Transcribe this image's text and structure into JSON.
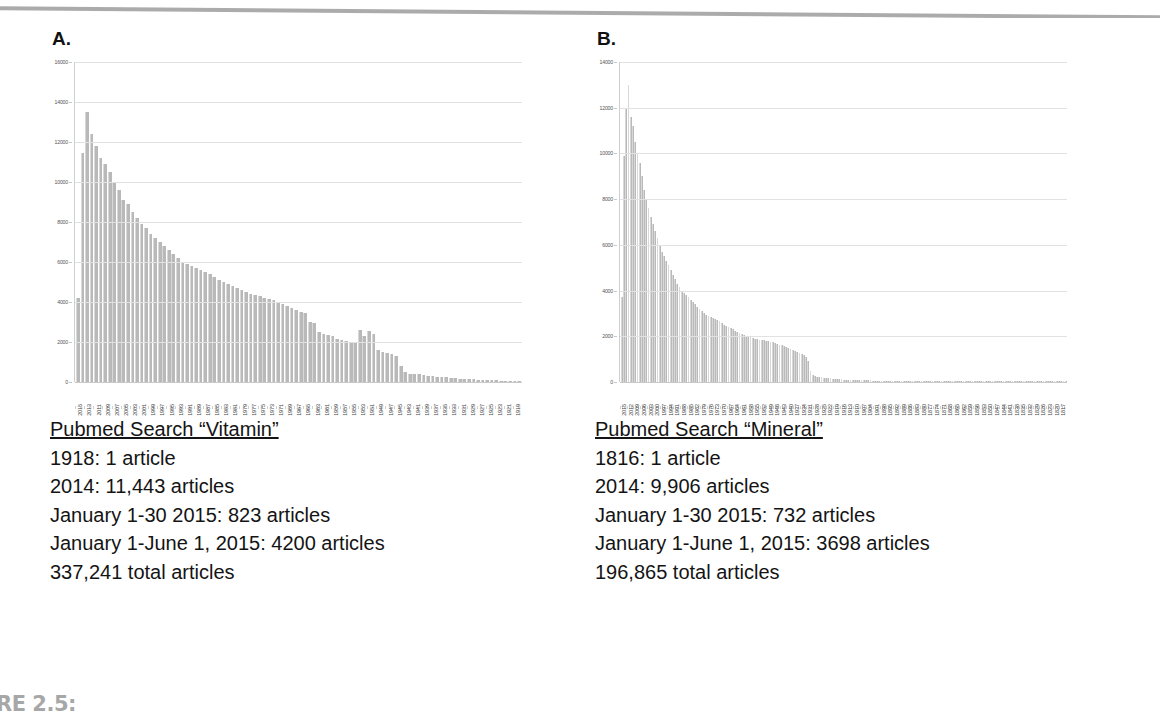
{
  "figure_label": "RE 2.5:",
  "panels": [
    {
      "letter": "A.",
      "caption": {
        "title": "Pubmed Search “Vitamin”",
        "lines": [
          "1918: 1 article",
          "2014: 11,443 articles",
          "January 1-30 2015: 823 articles",
          "January 1-June 1, 2015: 4200 articles",
          "337,241 total articles"
        ]
      }
    },
    {
      "letter": "B.",
      "caption": {
        "title": "Pubmed Search “Mineral”",
        "lines": [
          "1816: 1 article",
          "2014: 9,906 articles",
          "January 1-30 2015: 732 articles",
          "January 1-June 1, 2015: 3698 articles",
          "196,865 total articles"
        ]
      }
    }
  ],
  "chart_data": [
    {
      "type": "bar",
      "title": "Pubmed Search “Vitamin”",
      "xlabel": "",
      "ylabel": "",
      "ylim": [
        0,
        16000
      ],
      "yticks": [
        0,
        2000,
        4000,
        6000,
        8000,
        10000,
        12000,
        14000,
        16000
      ],
      "grid": true,
      "legend": "none",
      "label_step": 2,
      "categories": [
        2015,
        2014,
        2013,
        2012,
        2011,
        2010,
        2009,
        2008,
        2007,
        2006,
        2005,
        2004,
        2003,
        2002,
        2001,
        2000,
        1999,
        1998,
        1997,
        1996,
        1995,
        1994,
        1993,
        1992,
        1991,
        1990,
        1989,
        1988,
        1987,
        1986,
        1985,
        1984,
        1983,
        1982,
        1981,
        1980,
        1979,
        1978,
        1977,
        1976,
        1975,
        1974,
        1973,
        1972,
        1971,
        1970,
        1969,
        1968,
        1967,
        1966,
        1965,
        1964,
        1963,
        1962,
        1961,
        1960,
        1959,
        1958,
        1957,
        1956,
        1955,
        1954,
        1953,
        1952,
        1951,
        1950,
        1949,
        1948,
        1947,
        1946,
        1945,
        1944,
        1943,
        1942,
        1941,
        1940,
        1939,
        1938,
        1937,
        1936,
        1935,
        1934,
        1933,
        1932,
        1931,
        1930,
        1929,
        1928,
        1927,
        1926,
        1925,
        1924,
        1923,
        1922,
        1921,
        1920,
        1919,
        1918
      ],
      "values": [
        4200,
        11443,
        13500,
        12400,
        11800,
        11200,
        10900,
        10500,
        10000,
        9600,
        9100,
        8900,
        8500,
        8200,
        7900,
        7700,
        7400,
        7200,
        7000,
        6800,
        6600,
        6400,
        6200,
        6000,
        5900,
        5800,
        5700,
        5600,
        5500,
        5400,
        5250,
        5100,
        5000,
        4900,
        4800,
        4700,
        4600,
        4500,
        4400,
        4350,
        4300,
        4200,
        4150,
        4100,
        4000,
        3900,
        3800,
        3700,
        3600,
        3500,
        3450,
        3000,
        2950,
        2500,
        2400,
        2350,
        2300,
        2150,
        2100,
        2050,
        2000,
        1950,
        2600,
        2300,
        2550,
        2400,
        1600,
        1500,
        1450,
        1400,
        1300,
        800,
        500,
        420,
        400,
        380,
        340,
        310,
        290,
        270,
        250,
        230,
        210,
        190,
        175,
        160,
        145,
        130,
        120,
        110,
        100,
        90,
        80,
        70,
        60,
        50,
        40,
        20
      ]
    },
    {
      "type": "bar",
      "title": "Pubmed Search “Mineral”",
      "xlabel": "",
      "ylabel": "",
      "ylim": [
        0,
        14000
      ],
      "yticks": [
        0,
        2000,
        4000,
        6000,
        8000,
        10000,
        12000,
        14000
      ],
      "grid": true,
      "legend": "none",
      "label_step": 3,
      "categories": [
        2015,
        2014,
        2013,
        2012,
        2011,
        2010,
        2009,
        2008,
        2007,
        2006,
        2005,
        2004,
        2003,
        2002,
        2001,
        2000,
        1999,
        1998,
        1997,
        1996,
        1995,
        1994,
        1993,
        1992,
        1991,
        1990,
        1989,
        1988,
        1987,
        1986,
        1985,
        1984,
        1983,
        1982,
        1981,
        1980,
        1979,
        1978,
        1977,
        1976,
        1975,
        1974,
        1973,
        1972,
        1971,
        1970,
        1969,
        1968,
        1967,
        1966,
        1965,
        1964,
        1963,
        1962,
        1961,
        1960,
        1959,
        1958,
        1957,
        1956,
        1955,
        1954,
        1953,
        1952,
        1951,
        1950,
        1949,
        1948,
        1947,
        1946,
        1945,
        1944,
        1943,
        1942,
        1941,
        1940,
        1939,
        1938,
        1937,
        1936,
        1935,
        1934,
        1933,
        1932,
        1931,
        1930,
        1929,
        1928,
        1927,
        1926,
        1925,
        1924,
        1923,
        1922,
        1921,
        1920,
        1919,
        1918,
        1917,
        1916,
        1915,
        1914,
        1913,
        1912,
        1911,
        1910,
        1909,
        1908,
        1907,
        1906,
        1905,
        1904,
        1903,
        1902,
        1901,
        1900,
        1899,
        1898,
        1897,
        1896,
        1895,
        1894,
        1893,
        1892,
        1891,
        1890,
        1889,
        1888,
        1887,
        1886,
        1885,
        1884,
        1883,
        1882,
        1881,
        1880,
        1879,
        1878,
        1877,
        1876,
        1875,
        1874,
        1873,
        1872,
        1871,
        1870,
        1869,
        1868,
        1867,
        1866,
        1865,
        1864,
        1863,
        1862,
        1861,
        1860,
        1859,
        1858,
        1857,
        1856,
        1855,
        1854,
        1853,
        1852,
        1851,
        1850,
        1849,
        1848,
        1847,
        1846,
        1845,
        1844,
        1843,
        1842,
        1841,
        1840,
        1839,
        1838,
        1837,
        1836,
        1835,
        1834,
        1833,
        1832,
        1831,
        1830,
        1829,
        1828,
        1827,
        1826,
        1825,
        1824,
        1823,
        1822,
        1821,
        1820,
        1819,
        1818,
        1817,
        1816
      ],
      "values": [
        3698,
        9906,
        12000,
        13000,
        11600,
        11200,
        10500,
        10000,
        9600,
        9000,
        8400,
        8000,
        7600,
        7200,
        6900,
        6600,
        6300,
        6000,
        5700,
        5500,
        5300,
        5100,
        4900,
        4700,
        4500,
        4300,
        4150,
        4000,
        3900,
        3800,
        3700,
        3600,
        3500,
        3400,
        3300,
        3200,
        3100,
        3000,
        2950,
        2900,
        2850,
        2800,
        2750,
        2700,
        2650,
        2600,
        2500,
        2450,
        2400,
        2350,
        2300,
        2250,
        2200,
        2150,
        2100,
        2050,
        2000,
        1980,
        1960,
        1940,
        1900,
        1880,
        1860,
        1840,
        1820,
        1800,
        1780,
        1760,
        1740,
        1700,
        1660,
        1620,
        1600,
        1560,
        1520,
        1480,
        1440,
        1400,
        1360,
        1320,
        1280,
        1240,
        1200,
        1100,
        900,
        500,
        300,
        260,
        240,
        220,
        200,
        190,
        180,
        170,
        160,
        150,
        140,
        130,
        120,
        115,
        110,
        105,
        100,
        95,
        90,
        85,
        80,
        78,
        76,
        74,
        72,
        70,
        68,
        66,
        64,
        62,
        60,
        58,
        56,
        54,
        52,
        50,
        48,
        46,
        44,
        42,
        40,
        38,
        36,
        34,
        32,
        30,
        29,
        28,
        27,
        26,
        25,
        24,
        23,
        22,
        21,
        20,
        19,
        18,
        17,
        16,
        15,
        15,
        14,
        14,
        13,
        13,
        12,
        12,
        11,
        11,
        10,
        10,
        9,
        9,
        8,
        8,
        8,
        7,
        7,
        7,
        6,
        6,
        6,
        5,
        5,
        5,
        5,
        4,
        4,
        4,
        4,
        3,
        3,
        3,
        3,
        3,
        2,
        2,
        2,
        2,
        2,
        2,
        2,
        2,
        1,
        1,
        1,
        1,
        1,
        1,
        1,
        1,
        1,
        1,
        1
      ]
    }
  ]
}
